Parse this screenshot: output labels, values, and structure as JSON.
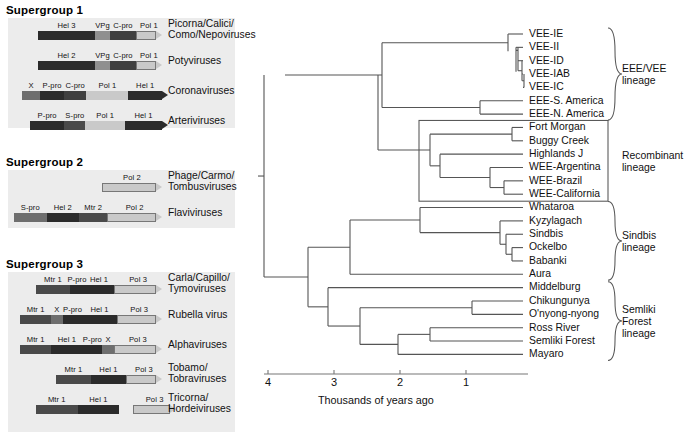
{
  "figure": {
    "left_panel_name": "viral-genome-organization",
    "right_panel_name": "alphavirus-phylogenetic-tree"
  },
  "supergroups": [
    {
      "title": "Supergroup 1",
      "rows": [
        {
          "virus": "Picorna/Calici/\nComo/Nepoviruses",
          "segments": [
            {
              "label": "Hel 3",
              "shade": "#2b2b2b"
            },
            {
              "label": "VPg",
              "shade": "#8f8f8f"
            },
            {
              "label": "C-pro",
              "shade": "#3f3f3f"
            },
            {
              "label": "Pol 1",
              "shade": "#c9c9c9"
            }
          ]
        },
        {
          "virus": "Potyviruses",
          "segments": [
            {
              "label": "Hel 2",
              "shade": "#2b2b2b"
            },
            {
              "label": "VPg",
              "shade": "#8f8f8f"
            },
            {
              "label": "C-pro",
              "shade": "#3f3f3f"
            },
            {
              "label": "Pol 1",
              "shade": "#c9c9c9"
            }
          ]
        },
        {
          "virus": "Coronaviruses",
          "segments": [
            {
              "label": "X",
              "shade": "#6e6e6e"
            },
            {
              "label": "P-pro",
              "shade": "#2b2b2b"
            },
            {
              "label": "C-pro",
              "shade": "#3f3f3f"
            },
            {
              "label": "Pol 1",
              "shade": "#c9c9c9"
            },
            {
              "label": "Hel 1",
              "shade": "#2b2b2b"
            }
          ]
        },
        {
          "virus": "Arteriviruses",
          "segments": [
            {
              "label": "P-pro",
              "shade": "#2b2b2b"
            },
            {
              "label": "S-pro",
              "shade": "#4a4a4a"
            },
            {
              "label": "Pol 1",
              "shade": "#c9c9c9"
            },
            {
              "label": "Hel 1",
              "shade": "#2b2b2b"
            }
          ]
        }
      ]
    },
    {
      "title": "Supergroup 2",
      "rows": [
        {
          "virus": "Phage/Carmo/\nTombusviruses",
          "segments": [
            {
              "label": "Pol 2",
              "shade": "#c9c9c9"
            }
          ]
        },
        {
          "virus": "Flaviviruses",
          "segments": [
            {
              "label": "S-pro",
              "shade": "#6e6e6e"
            },
            {
              "label": "Hel 2",
              "shade": "#2b2b2b"
            },
            {
              "label": "Mtr 2",
              "shade": "#4a4a4a"
            },
            {
              "label": "Pol 2",
              "shade": "#c9c9c9"
            }
          ]
        }
      ]
    },
    {
      "title": "Supergroup 3",
      "rows": [
        {
          "virus": "Carla/Capillo/\nTymoviruses",
          "segments": [
            {
              "label": "Mtr 1",
              "shade": "#4a4a4a"
            },
            {
              "label": "P-pro",
              "shade": "#2b2b2b"
            },
            {
              "label": "Hel 1",
              "shade": "#2b2b2b"
            },
            {
              "label": "Pol 3",
              "shade": "#c9c9c9"
            }
          ]
        },
        {
          "virus": "Rubella virus",
          "segments": [
            {
              "label": "Mtr 1",
              "shade": "#4a4a4a"
            },
            {
              "label": "X",
              "shade": "#6e6e6e"
            },
            {
              "label": "P-pro",
              "shade": "#2b2b2b"
            },
            {
              "label": "Hel 1",
              "shade": "#2b2b2b"
            },
            {
              "label": "Pol 3",
              "shade": "#c9c9c9"
            }
          ]
        },
        {
          "virus": "Alphaviruses",
          "segments": [
            {
              "label": "Mtr 1",
              "shade": "#4a4a4a"
            },
            {
              "label": "Hel 1",
              "shade": "#2b2b2b"
            },
            {
              "label": "P-pro",
              "shade": "#2b2b2b"
            },
            {
              "label": "X",
              "shade": "#6e6e6e"
            },
            {
              "label": "Pol 3",
              "shade": "#c9c9c9"
            }
          ]
        },
        {
          "virus": "Tobamo/\nTobraviruses",
          "segments": [
            {
              "label": "Mtr 1",
              "shade": "#4a4a4a"
            },
            {
              "label": "Hel 1",
              "shade": "#2b2b2b"
            },
            {
              "label": "Pol 3",
              "shade": "#c9c9c9"
            }
          ]
        },
        {
          "virus": "Tricorna/\nHordeiviruses",
          "segments": [
            {
              "label": "Mtr 1",
              "shade": "#4a4a4a"
            },
            {
              "label": "Hel 1",
              "shade": "#2b2b2b"
            },
            {
              "label": "Pol 3",
              "shade": "#c9c9c9"
            }
          ]
        }
      ]
    }
  ],
  "chart_data": {
    "type": "tree",
    "title": "",
    "xlabel": "Thousands of years ago",
    "axis_ticks": [
      "4",
      "3",
      "2",
      "1"
    ],
    "axis_range": [
      4,
      0.5
    ],
    "axis_direction": "reversed",
    "grid": false,
    "taxa": [
      "VEE-IE",
      "VEE-II",
      "VEE-ID",
      "VEE-IAB",
      "VEE-IC",
      "EEE-S. America",
      "EEE-N. America",
      "Fort Morgan",
      "Buggy Creek",
      "Highlands J",
      "WEE-Argentina",
      "WEE-Brazil",
      "WEE-California",
      "Whataroa",
      "Kyzylagach",
      "Sindbis",
      "Ockelbo",
      "Babanki",
      "Aura",
      "Middelburg",
      "Chikungunya",
      "O'nyong-nyong",
      "Ross River",
      "Semliki Forest",
      "Mayaro"
    ],
    "lineages": [
      {
        "name": "EEE/VEE\nlineage",
        "bracket": "brace",
        "members": [
          "VEE-IE",
          "VEE-II",
          "VEE-ID",
          "VEE-IAB",
          "VEE-IC",
          "EEE-S. America",
          "EEE-N. America"
        ]
      },
      {
        "name": "Recombinant\nlineage",
        "bracket": "box",
        "members": [
          "Fort Morgan",
          "Buggy Creek",
          "Highlands J",
          "WEE-Argentina",
          "WEE-Brazil",
          "WEE-California"
        ]
      },
      {
        "name": "Sindbis\nlineage",
        "bracket": "brace",
        "members": [
          "Whataroa",
          "Kyzylagach",
          "Sindbis",
          "Ockelbo",
          "Babanki",
          "Aura"
        ]
      },
      {
        "name": "Semliki\nForest\nlineage",
        "bracket": "brace",
        "members": [
          "Middelburg",
          "Chikungunya",
          "O'nyong-nyong",
          "Ross River",
          "Semliki Forest",
          "Mayaro"
        ]
      }
    ]
  }
}
